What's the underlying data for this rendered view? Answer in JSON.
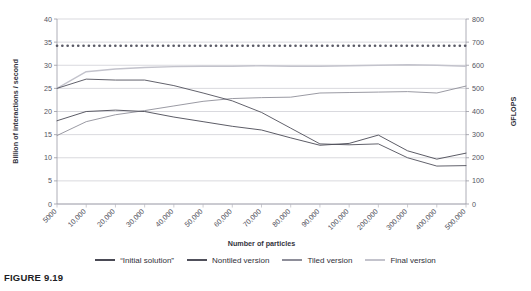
{
  "caption": "FIGURE 9.19",
  "legend": {
    "position": "bottom",
    "items": [
      {
        "label": "“Initial solution”",
        "color": "#4a4a55",
        "style": "solid"
      },
      {
        "label": "Nontiled version",
        "color": "#50505b",
        "style": "solid"
      },
      {
        "label": "Tiled version",
        "color": "#8e8e99",
        "style": "solid"
      },
      {
        "label": "Final version",
        "color": "#c3c3cc",
        "style": "solid"
      }
    ]
  },
  "chart_data": {
    "type": "line",
    "title": "",
    "xlabel": "Number of particles",
    "ylabel": "Billion of interactions / second",
    "y2label": "GFLOPS",
    "grid": true,
    "ylim": [
      0,
      40
    ],
    "yticks": [
      0,
      5,
      10,
      15,
      20,
      25,
      30,
      35,
      40
    ],
    "y2lim": [
      0,
      800
    ],
    "y2ticks": [
      0,
      100,
      200,
      300,
      400,
      500,
      600,
      700,
      800
    ],
    "categories": [
      "5000",
      "10,000",
      "20,000",
      "30,000",
      "40,000",
      "50,000",
      "60,000",
      "70,000",
      "80,000",
      "90,000",
      "100,000",
      "200,000",
      "300,000",
      "400,000",
      "500,000"
    ],
    "series": [
      {
        "name": "“Initial solution”",
        "color": "#4a4a55",
        "width": 0.9,
        "values": [
          18.0,
          20.0,
          20.3,
          20.0,
          18.8,
          17.8,
          16.8,
          16.0,
          14.3,
          12.7,
          13.1,
          14.9,
          11.5,
          9.7,
          11.0
        ]
      },
      {
        "name": "Nontiled version",
        "color": "#50505b",
        "width": 0.9,
        "values": [
          25.0,
          27.0,
          26.8,
          26.8,
          25.6,
          24.0,
          22.3,
          19.8,
          16.4,
          13.0,
          12.8,
          13.0,
          10.0,
          8.2,
          8.3
        ]
      },
      {
        "name": "Tiled version",
        "color": "#8e8e99",
        "width": 0.9,
        "values": [
          14.8,
          17.8,
          19.3,
          20.2,
          21.2,
          22.2,
          22.8,
          23.0,
          23.1,
          24.0,
          24.1,
          24.2,
          24.3,
          24.0,
          25.5
        ]
      },
      {
        "name": "Final version",
        "color": "#c3c3cc",
        "width": 1.4,
        "values": [
          25.0,
          28.6,
          29.2,
          29.5,
          29.7,
          29.8,
          29.8,
          29.9,
          29.8,
          29.8,
          29.9,
          30.0,
          30.1,
          30.0,
          29.8
        ]
      },
      {
        "name": "peak-reference",
        "color": "#5a5a66",
        "width": 1.5,
        "style": "dotted",
        "values": [
          34.2,
          34.2,
          34.2,
          34.2,
          34.2,
          34.2,
          34.2,
          34.2,
          34.2,
          34.2,
          34.2,
          34.2,
          34.2,
          34.2,
          34.2
        ]
      }
    ]
  }
}
